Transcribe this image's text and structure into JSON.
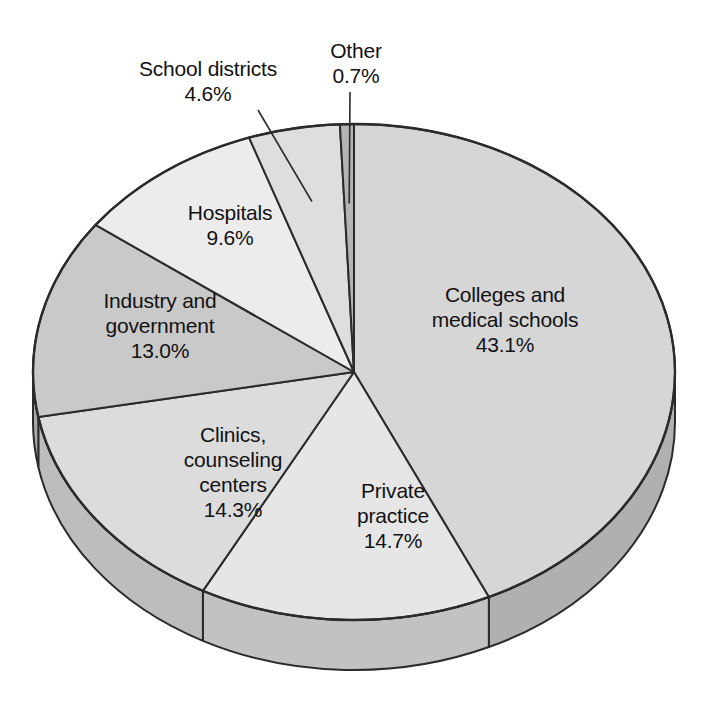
{
  "chart_data": {
    "type": "pie",
    "title": "",
    "xlabel": "",
    "ylabel": "",
    "legend": "none (direct labels)",
    "grid": false,
    "style": "3d-pie",
    "total_percent": 100.0,
    "start_angle_deg": 0,
    "direction": "clockwise",
    "categories": [
      "Colleges and medical schools",
      "Private practice",
      "Clinics, counseling centers",
      "Industry and government",
      "Hospitals",
      "School districts",
      "Other"
    ],
    "values": [
      43.1,
      14.7,
      14.3,
      13.0,
      9.6,
      4.6,
      0.7
    ],
    "value_labels": [
      "43.1%",
      "14.7%",
      "14.3%",
      "13.0%",
      "9.6%",
      "4.6%",
      "0.7%"
    ],
    "slice_colors": [
      "#d6d6d6",
      "#e6e6e6",
      "#dcdcdc",
      "#c9c9c9",
      "#ececec",
      "#dedede",
      "#b4b4b4"
    ],
    "side_colors": [
      "#b0b0b0",
      "#c2c2c2",
      "#bdbdbd",
      "#a8a8a8",
      "#c8c8c8",
      "#bababa",
      "#9a9a9a"
    ],
    "slices": [
      {
        "name": "Colleges and medical schools",
        "label_line1": "Colleges and",
        "label_line2": "medical schools",
        "percent_label": "43.1%",
        "value": 43.1,
        "label_placement": "inside"
      },
      {
        "name": "Private practice",
        "label_line1": "Private",
        "label_line2": "practice",
        "percent_label": "14.7%",
        "value": 14.7,
        "label_placement": "inside"
      },
      {
        "name": "Clinics, counseling centers",
        "label_line1": "Clinics,",
        "label_line2": "counseling",
        "label_line3": "centers",
        "percent_label": "14.3%",
        "value": 14.3,
        "label_placement": "inside"
      },
      {
        "name": "Industry and government",
        "label_line1": "Industry and",
        "label_line2": "government",
        "percent_label": "13.0%",
        "value": 13.0,
        "label_placement": "inside"
      },
      {
        "name": "Hospitals",
        "label_line1": "Hospitals",
        "percent_label": "9.6%",
        "value": 9.6,
        "label_placement": "inside"
      },
      {
        "name": "School districts",
        "label_line1": "School districts",
        "percent_label": "4.6%",
        "value": 4.6,
        "label_placement": "callout-outside"
      },
      {
        "name": "Other",
        "label_line1": "Other",
        "percent_label": "0.7%",
        "value": 0.7,
        "label_placement": "callout-outside"
      }
    ]
  },
  "labels": {
    "colleges": "Colleges and\nmedical schools\n43.1%",
    "private_practice": "Private\npractice\n14.7%",
    "clinics": "Clinics,\ncounseling\ncenters\n14.3%",
    "industry": "Industry and\ngovernment\n13.0%",
    "hospitals": "Hospitals\n9.6%",
    "school_districts": "School districts\n4.6%",
    "other": "Other\n0.7%"
  },
  "geometry": {
    "center_x": 354,
    "center_y": 372,
    "radius_x": 321,
    "radius_y": 248,
    "depth": 50
  },
  "colors": {
    "background": "#ffffff",
    "outline": "#2b2b2b",
    "text": "#121212"
  }
}
